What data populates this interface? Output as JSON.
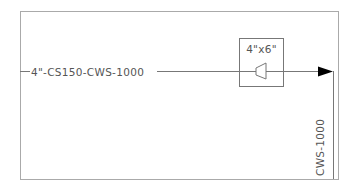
{
  "diagram": {
    "pipe_label": "4\"-CS150-CWS-1000",
    "reducer_label": "4\"x6\"",
    "branch_label": "CWS-1000",
    "colors": {
      "frame": "#aaaaaa",
      "line": "#777777",
      "arrow": "#000000",
      "text": "#555555"
    }
  }
}
